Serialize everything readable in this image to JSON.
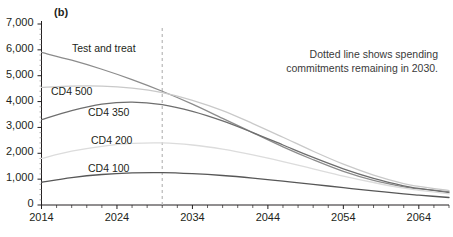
{
  "panel": {
    "label": "(b)"
  },
  "annotation": {
    "text": "Dotted line shows spending commitments remaining in 2030."
  },
  "colors": {
    "axis": "#231f20",
    "text": "#231f20",
    "dashed_line": "#b8b8b8",
    "test_and_treat": "#8c8c8c",
    "cd4_500": "#c9c9c9",
    "cd4_350": "#6e6e6e",
    "cd4_200": "#dcdcdc",
    "cd4_100": "#575757"
  },
  "chart_data": {
    "type": "line",
    "title": "(b)",
    "xlabel": "",
    "ylabel": "",
    "xlim": [
      2014,
      2068
    ],
    "ylim": [
      0,
      7000
    ],
    "grid": false,
    "legend": "inline-labels",
    "x_tick_labels": [
      "2014",
      "2024",
      "2034",
      "2044",
      "2054",
      "2064"
    ],
    "x_tick_values": [
      2014,
      2024,
      2034,
      2044,
      2054,
      2064
    ],
    "x_minor_tick_step": 2,
    "y_tick_labels": [
      "0",
      "1,000",
      "2,000",
      "3,000",
      "4,000",
      "5,000",
      "6,000",
      "7,000"
    ],
    "y_tick_values": [
      0,
      1000,
      2000,
      3000,
      4000,
      5000,
      6000,
      7000
    ],
    "annotations": [
      {
        "type": "vline",
        "x": 2030,
        "style": "dashed",
        "note": "Dotted line shows spending commitments remaining in 2030."
      }
    ],
    "x": [
      2014,
      2018,
      2022,
      2026,
      2030,
      2034,
      2038,
      2042,
      2046,
      2050,
      2054,
      2058,
      2062,
      2064,
      2068
    ],
    "series": [
      {
        "name": "Test and treat",
        "color": "#8c8c8c",
        "values": [
          5900,
          5600,
          5250,
          4850,
          4400,
          3900,
          3350,
          2800,
          2250,
          1750,
          1300,
          950,
          700,
          620,
          520
        ]
      },
      {
        "name": "CD4 500",
        "color": "#c9c9c9",
        "values": [
          4550,
          4600,
          4600,
          4520,
          4350,
          4050,
          3650,
          3150,
          2620,
          2080,
          1580,
          1160,
          830,
          720,
          560
        ]
      },
      {
        "name": "CD4 350",
        "color": "#6e6e6e",
        "values": [
          3300,
          3650,
          3900,
          3980,
          3880,
          3620,
          3250,
          2800,
          2320,
          1840,
          1400,
          1030,
          740,
          640,
          480
        ]
      },
      {
        "name": "CD4 200",
        "color": "#dcdcdc",
        "values": [
          1800,
          2080,
          2270,
          2380,
          2400,
          2320,
          2160,
          1940,
          1680,
          1400,
          1120,
          870,
          650,
          570,
          430
        ]
      },
      {
        "name": "CD4 100",
        "color": "#575757",
        "values": [
          880,
          1060,
          1180,
          1240,
          1250,
          1210,
          1140,
          1040,
          920,
          800,
          670,
          550,
          430,
          380,
          290
        ]
      }
    ]
  },
  "series_labels": [
    {
      "text": "Test and treat",
      "left": 72,
      "top": 42
    },
    {
      "text": "CD4 500",
      "left": 51,
      "top": 85
    },
    {
      "text": "CD4 350",
      "left": 88,
      "top": 106
    },
    {
      "text": "CD4 200",
      "left": 91,
      "top": 134
    },
    {
      "text": "CD4 100",
      "left": 88,
      "top": 162
    }
  ]
}
